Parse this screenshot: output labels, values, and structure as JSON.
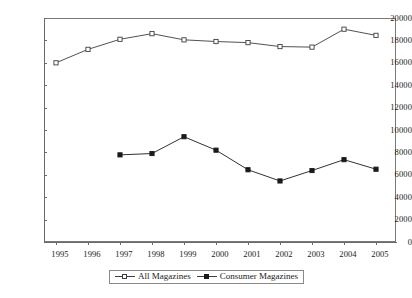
{
  "chart_data": {
    "type": "line",
    "title": "",
    "subtitle": "",
    "xlabel": "",
    "ylabel": "",
    "categories": [
      "1995",
      "1996",
      "1997",
      "1998",
      "1999",
      "2000",
      "2001",
      "2002",
      "2003",
      "2004",
      "2005"
    ],
    "x": [
      1995,
      1996,
      1997,
      1998,
      1999,
      2000,
      2001,
      2002,
      2003,
      2004,
      2005
    ],
    "ylim": [
      0,
      20000
    ],
    "ytick_values": [
      0,
      2000,
      4000,
      6000,
      8000,
      10000,
      12000,
      14000,
      16000,
      18000,
      20000
    ],
    "ytick_labels": [
      "0",
      "2000",
      "4000",
      "6000",
      "8000",
      "10000",
      "12000",
      "14000",
      "16000",
      "18000",
      "20000"
    ],
    "xtick_labels": [
      "1995",
      "1996",
      "1997",
      "1998",
      "1999",
      "2000",
      "2001",
      "2002",
      "2003",
      "2004",
      "2005"
    ],
    "grid": false,
    "legend_position": "bottom-center",
    "series": [
      {
        "name": "All Magazines",
        "marker": "open-square",
        "color": "#3d3d3d",
        "values": [
          16000,
          17200,
          18100,
          18600,
          18050,
          17900,
          17800,
          17450,
          17400,
          19000,
          18450
        ]
      },
      {
        "name": "Consumer Magazines",
        "marker": "filled-square",
        "color": "#1a1a1a",
        "values": [
          null,
          null,
          7780,
          7900,
          9400,
          8200,
          6450,
          5450,
          6380,
          7350,
          6500
        ]
      }
    ]
  },
  "legend": {
    "entries": [
      {
        "label": "All Magazines"
      },
      {
        "label": "Consumer Magazines"
      }
    ]
  },
  "colors": {
    "axis": "#6a6a6a",
    "frame": "#7a7a7a",
    "series_all": "#3d3d3d",
    "series_consumer": "#1a1a1a",
    "background": "#ffffff"
  }
}
